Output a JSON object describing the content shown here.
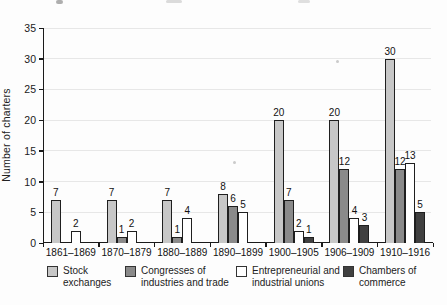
{
  "chart_data": {
    "type": "bar",
    "title": "",
    "ylabel": "Number of charters",
    "xlabel": "",
    "ylim": [
      0,
      35
    ],
    "ytick_step": 5,
    "grid": true,
    "legend_position": "bottom",
    "categories": [
      "1861–1869",
      "1870–1879",
      "1880–1889",
      "1890–1899",
      "1900–1905",
      "1906–1909",
      "1910–1916"
    ],
    "series": [
      {
        "name": "Stock exchanges",
        "legend_lines": [
          "Stock",
          "exchanges"
        ],
        "color": "#c7c7c7",
        "values": [
          7,
          7,
          7,
          8,
          20,
          20,
          30
        ]
      },
      {
        "name": "Congresses of industries and trade",
        "legend_lines": [
          "Congresses of",
          "industries and trade"
        ],
        "color": "#8a8a8a",
        "values": [
          0,
          1,
          1,
          6,
          7,
          12,
          12
        ]
      },
      {
        "name": "Entrepreneurial and industrial unions",
        "legend_lines": [
          "Entrepreneurial and",
          "industrial unions"
        ],
        "color": "#ffffff",
        "values": [
          2,
          2,
          4,
          5,
          2,
          4,
          13
        ]
      },
      {
        "name": "Chambers of commerce",
        "legend_lines": [
          "Chambers of",
          "commerce"
        ],
        "color": "#404040",
        "values": [
          0,
          0,
          0,
          0,
          1,
          3,
          5
        ]
      }
    ],
    "bar_border_color": "#1f1f1f",
    "gridline_color": "#e7e7e7",
    "axis_color": "#1a1a1a",
    "show_value_labels": true
  }
}
